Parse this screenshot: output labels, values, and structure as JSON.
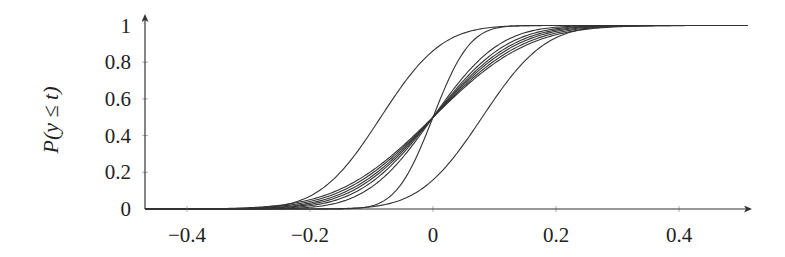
{
  "chart_data": {
    "type": "line",
    "title": "",
    "xlabel": "",
    "ylabel": "P(y ≤ t)",
    "xlim": [
      -0.46,
      0.51
    ],
    "ylim": [
      0,
      1
    ],
    "xticks": [
      -0.4,
      -0.2,
      0,
      0.2,
      0.4
    ],
    "xtick_labels": [
      "−0.4",
      "−0.2",
      "0",
      "0.2",
      "0.4"
    ],
    "yticks": [
      0,
      0.2,
      0.4,
      0.6,
      0.8,
      1
    ],
    "ytick_labels": [
      "0",
      "0.2",
      "0.4",
      "0.6",
      "0.8",
      "1"
    ],
    "grid": false,
    "legend": null,
    "curve_model": "normal CDF, P(y<=t) = Phi((t - mu)/sigma)",
    "series": [
      {
        "name": "curve-1",
        "mu": -0.085,
        "sigma": 0.078
      },
      {
        "name": "curve-2",
        "mu": 0.08,
        "sigma": 0.08
      },
      {
        "name": "curve-3",
        "mu": 0.0,
        "sigma": 0.047
      },
      {
        "name": "curve-4",
        "mu": 0.0,
        "sigma": 0.085
      },
      {
        "name": "curve-5",
        "mu": 0.0,
        "sigma": 0.095
      },
      {
        "name": "curve-6",
        "mu": 0.0,
        "sigma": 0.102
      },
      {
        "name": "curve-7",
        "mu": 0.0,
        "sigma": 0.108
      },
      {
        "name": "curve-8",
        "mu": 0.0,
        "sigma": 0.115
      },
      {
        "name": "curve-9",
        "mu": 0.0,
        "sigma": 0.122
      }
    ],
    "sample_x": [
      -0.3,
      -0.2,
      -0.1,
      0,
      0.1,
      0.2,
      0.3
    ],
    "sample_values": {
      "curve-1": [
        0.003,
        0.07,
        0.42,
        0.86,
        0.99,
        1.0,
        1.0
      ],
      "curve-2": [
        0.0,
        0.0,
        0.01,
        0.16,
        0.6,
        0.93,
        1.0
      ],
      "curve-3": [
        0.0,
        0.0,
        0.02,
        0.5,
        0.98,
        1.0,
        1.0
      ],
      "curve-5": [
        0.001,
        0.02,
        0.15,
        0.5,
        0.85,
        0.98,
        1.0
      ],
      "curve-9": [
        0.007,
        0.05,
        0.21,
        0.5,
        0.79,
        0.95,
        0.99
      ]
    }
  },
  "layout": {
    "plot_left_px": 145,
    "x_zero_px": 433,
    "px_per_unit_x": 615,
    "y_zero_px": 209,
    "px_per_unit_y": 183.5,
    "x_axis_end_px": 750,
    "y_axis_top_px": 16
  }
}
